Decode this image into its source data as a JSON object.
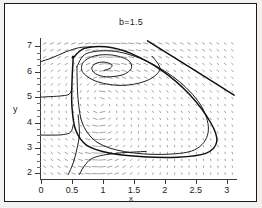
{
  "figure": {
    "kind": "phase-portrait",
    "background": "#ffffff",
    "frame_color": "#1b1b1b",
    "page_color": "#f2f1ef"
  },
  "chart_data": {
    "type": "line",
    "plot_kind": "phase-plane-vector-field-with-trajectories",
    "title": "b=1.5",
    "xlabel": "x",
    "ylabel": "y",
    "xlim": [
      0,
      3.15
    ],
    "ylim": [
      1.85,
      7.25
    ],
    "grid": false,
    "legend": null,
    "xticks": [
      0,
      0.5,
      1,
      1.5,
      2,
      2.5,
      3
    ],
    "xtick_labels": [
      "0",
      "0.5",
      "1",
      "1.5",
      "2",
      "2.5",
      "3"
    ],
    "yticks": [
      2,
      3,
      4,
      5,
      6,
      7
    ],
    "ytick_labels": [
      "2",
      "3",
      "4",
      "5",
      "6",
      "7"
    ],
    "y_minor_ticks": [
      2.25,
      2.5,
      2.75,
      3.25,
      3.5,
      3.75,
      4.25,
      4.5,
      4.75,
      5.25,
      5.5,
      5.75,
      6.25,
      6.5,
      6.75
    ],
    "annotations": [
      {
        "text": "b=1.5",
        "role": "title",
        "x": 1.55,
        "y": 7.6
      }
    ],
    "features": {
      "fixed_points": [
        {
          "type": "unstable-spiral-focus",
          "x": 1.02,
          "y": 6.05
        }
      ],
      "limit_cycle": {
        "present": true,
        "approx_x_range": [
          0.5,
          2.85
        ],
        "approx_y_range": [
          2.6,
          6.95
        ]
      },
      "vector_field": {
        "style": "short gray dashes",
        "nx": 26,
        "ny": 19,
        "color": "#8d8d8d"
      },
      "separatrix": {
        "present": true,
        "description": "straight descending line across upper-right region",
        "p1": [
          1.72,
          7.2
        ],
        "p2": [
          3.12,
          5.1
        ]
      }
    },
    "series": [
      {
        "name": "limit-cycle",
        "kind": "closed-orbit",
        "points": [
          [
            0.52,
            6.55
          ],
          [
            0.7,
            6.92
          ],
          [
            1.05,
            6.98
          ],
          [
            1.45,
            6.72
          ],
          [
            1.95,
            6.05
          ],
          [
            2.4,
            5.1
          ],
          [
            2.74,
            4.0
          ],
          [
            2.84,
            3.25
          ],
          [
            2.66,
            2.78
          ],
          [
            2.2,
            2.63
          ],
          [
            1.6,
            2.66
          ],
          [
            1.1,
            2.8
          ],
          [
            0.74,
            3.1
          ],
          [
            0.56,
            3.7
          ],
          [
            0.5,
            4.6
          ],
          [
            0.5,
            5.6
          ],
          [
            0.52,
            6.55
          ]
        ]
      },
      {
        "name": "inner-spiral-outward",
        "kind": "trajectory",
        "points": [
          [
            1.02,
            6.05
          ],
          [
            1.12,
            6.14
          ],
          [
            1.14,
            6.28
          ],
          [
            1.02,
            6.38
          ],
          [
            0.88,
            6.32
          ],
          [
            0.82,
            6.14
          ],
          [
            0.88,
            5.92
          ],
          [
            1.06,
            5.8
          ],
          [
            1.32,
            5.88
          ],
          [
            1.46,
            6.14
          ],
          [
            1.4,
            6.46
          ],
          [
            1.14,
            6.66
          ],
          [
            0.86,
            6.62
          ],
          [
            0.68,
            6.36
          ],
          [
            0.68,
            5.96
          ],
          [
            0.92,
            5.6
          ],
          [
            1.32,
            5.46
          ],
          [
            1.72,
            5.66
          ],
          [
            1.92,
            6.1
          ],
          [
            1.8,
            6.6
          ]
        ]
      },
      {
        "name": "outer-approach-orbit",
        "kind": "trajectory",
        "points": [
          [
            0.58,
            6.2
          ],
          [
            0.74,
            6.72
          ],
          [
            1.2,
            6.8
          ],
          [
            1.72,
            6.4
          ],
          [
            2.24,
            5.6
          ],
          [
            2.6,
            4.6
          ],
          [
            2.7,
            3.6
          ],
          [
            2.48,
            2.92
          ],
          [
            1.95,
            2.74
          ],
          [
            1.35,
            2.85
          ],
          [
            0.92,
            3.2
          ],
          [
            0.68,
            3.9
          ],
          [
            0.6,
            4.9
          ],
          [
            0.58,
            6.2
          ]
        ]
      },
      {
        "name": "incoming-left-upper",
        "kind": "trajectory",
        "points": [
          [
            0.0,
            6.4
          ],
          [
            0.18,
            6.55
          ],
          [
            0.4,
            6.78
          ],
          [
            0.62,
            6.95
          ],
          [
            0.82,
            6.98
          ]
        ]
      },
      {
        "name": "incoming-left-mid",
        "kind": "trajectory",
        "points": [
          [
            0.0,
            5.0
          ],
          [
            0.16,
            5.02
          ],
          [
            0.34,
            5.05
          ],
          [
            0.46,
            5.12
          ],
          [
            0.5,
            5.35
          ]
        ]
      },
      {
        "name": "incoming-left-low",
        "kind": "trajectory",
        "points": [
          [
            0.0,
            3.5
          ],
          [
            0.18,
            3.5
          ],
          [
            0.36,
            3.52
          ],
          [
            0.48,
            3.62
          ],
          [
            0.52,
            3.9
          ]
        ]
      },
      {
        "name": "lower-inflow-a",
        "kind": "trajectory",
        "points": [
          [
            0.44,
            1.95
          ],
          [
            0.52,
            2.4
          ],
          [
            0.58,
            2.95
          ],
          [
            0.62,
            3.55
          ],
          [
            0.6,
            4.3
          ]
        ]
      },
      {
        "name": "lower-inflow-b",
        "kind": "trajectory",
        "points": [
          [
            0.62,
            1.95
          ],
          [
            0.72,
            2.35
          ],
          [
            0.86,
            2.62
          ],
          [
            1.2,
            2.78
          ],
          [
            1.7,
            2.86
          ]
        ]
      },
      {
        "name": "separatrix-line",
        "kind": "line",
        "points": [
          [
            1.72,
            7.22
          ],
          [
            3.12,
            5.08
          ]
        ]
      }
    ]
  }
}
